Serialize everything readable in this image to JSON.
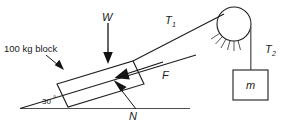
{
  "figure": {
    "kind": "free-body-diagram",
    "background_color": "#ffffff",
    "line_color": "#1d1d1d"
  },
  "labels": {
    "block_mass": "100 kg block",
    "weight": "W",
    "tension_incline_symbol": "T",
    "tension_incline_sub": "1",
    "tension_hanging_symbol": "T",
    "tension_hanging_sub": "2",
    "friction": "F",
    "normal": "N",
    "hanging_mass": "m",
    "angle": "30",
    "angle_unit": "°"
  },
  "geometry": {
    "incline_angle_deg": 30,
    "incline_base_point": [
      20,
      108
    ],
    "incline_top_point": [
      196,
      55
    ],
    "ground_line": [
      20,
      108,
      190,
      108
    ],
    "pulley_center": [
      234,
      24
    ],
    "pulley_radius": 17,
    "hanging_box": [
      250,
      70,
      35,
      30
    ],
    "block_corner_low": [
      57,
      84
    ],
    "block_corner_high": [
      133,
      62
    ]
  },
  "arrows": {
    "weight": {
      "from": [
        108,
        22
      ],
      "to": [
        108,
        62
      ],
      "label": "W"
    },
    "normal": {
      "from": [
        134,
        108
      ],
      "to": [
        114,
        81
      ],
      "label": "N"
    },
    "friction": {
      "from": [
        160,
        62
      ],
      "to": [
        114,
        77
      ],
      "label": "F"
    },
    "pointer_block": {
      "from": [
        47,
        56
      ],
      "to": [
        64,
        70
      ],
      "label": "100 kg block"
    }
  },
  "colors": {
    "ink": "#1d1d1d",
    "rope": "#555555",
    "hatch": "#2b2b2b"
  }
}
